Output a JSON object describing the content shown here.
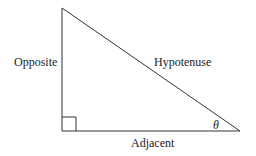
{
  "diagram": {
    "type": "right-triangle",
    "labels": {
      "opposite": "Opposite",
      "hypotenuse": "Hypotenuse",
      "adjacent": "Adjacent",
      "angle": "θ"
    },
    "vertices": {
      "top": [
        62,
        8
      ],
      "right_angle": [
        62,
        131
      ],
      "angle_vertex": [
        240,
        131
      ]
    },
    "line_color": "#333333"
  }
}
